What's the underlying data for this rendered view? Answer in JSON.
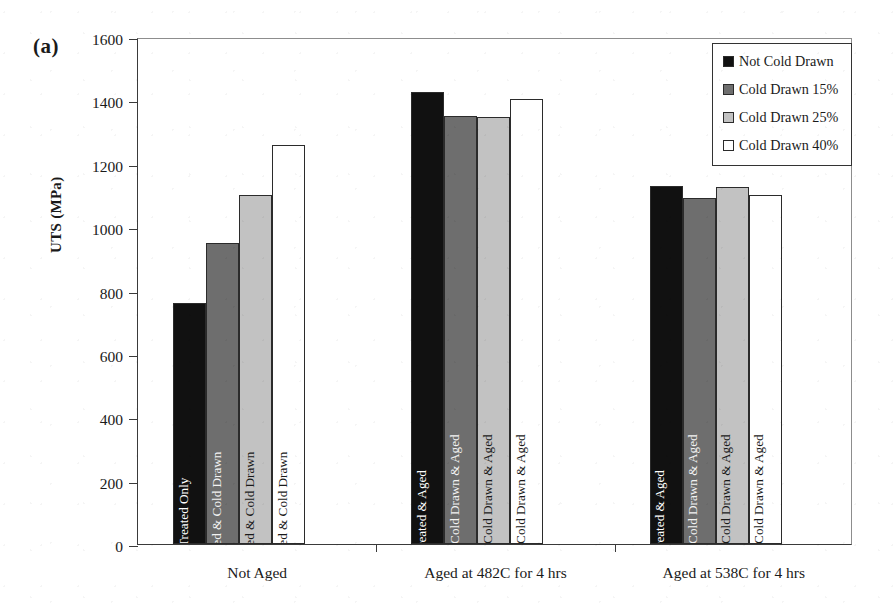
{
  "panel_label": "(a)",
  "axis": {
    "y_title": "UTS (MPa)",
    "y_ticks": [
      "1600",
      "1400",
      "1200",
      "1000",
      "800",
      "600",
      "400",
      "200",
      "0"
    ],
    "y_min": 0,
    "y_max": 1600
  },
  "legend": {
    "items": [
      {
        "label": "Not Cold Drawn",
        "color": "#111111"
      },
      {
        "label": "Cold Drawn 15%",
        "color": "#6e6e6e"
      },
      {
        "label": "Cold Drawn 25%",
        "color": "#c2c2c2"
      },
      {
        "label": "Cold Drawn 40%",
        "color": "#ffffff"
      }
    ]
  },
  "chart_data": {
    "type": "bar",
    "title": "(a)",
    "xlabel": "",
    "ylabel": "UTS (MPa)",
    "ylim": [
      0,
      1600
    ],
    "ytick_step": 200,
    "grid": false,
    "legend_position": "top-right",
    "categories": [
      "Not Aged",
      "Aged at 482C for 4 hrs",
      "Aged at 538C for 4 hrs"
    ],
    "series": [
      {
        "name": "Not Cold Drawn",
        "color": "#111111",
        "values": [
          760,
          1428,
          1130
        ]
      },
      {
        "name": "Cold Drawn 15%",
        "color": "#6e6e6e",
        "values": [
          950,
          1352,
          1093
        ]
      },
      {
        "name": "Cold Drawn 25%",
        "color": "#c2c2c2",
        "values": [
          1100,
          1348,
          1128
        ]
      },
      {
        "name": "Cold Drawn 40%",
        "color": "#ffffff",
        "values": [
          1258,
          1403,
          1102
        ]
      }
    ],
    "bar_annotations": [
      [
        "Solution Treated Only",
        "Solution Treated & Cold Drawn",
        "Solution Treated & Cold Drawn",
        "Solution Treated & Cold Drawn"
      ],
      [
        "Solution Treated & Aged",
        "Solution Treated, Cold Drawn & Aged",
        "Solution Treated, Cold Drawn & Aged",
        "Solution Treated, Cold Drawn & Aged"
      ],
      [
        "Solution Treated & Aged",
        "Solution Treated, Cold Drawn & Aged",
        "Solution Treated, Cold Drawn & Aged",
        "Solution Treated, Cold Drawn & Aged"
      ]
    ]
  }
}
